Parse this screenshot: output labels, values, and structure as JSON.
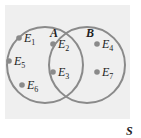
{
  "universe_label": "S",
  "sets": [
    {
      "name": "A",
      "elements": [
        "E1",
        "E5",
        "E6",
        "E2",
        "E3"
      ]
    },
    {
      "name": "B",
      "elements": [
        "E2",
        "E3",
        "E4",
        "E7"
      ]
    }
  ],
  "points": [
    {
      "base": "E",
      "sub": "1",
      "x": 26,
      "y": 42
    },
    {
      "base": "E",
      "sub": "5",
      "x": 16,
      "y": 65
    },
    {
      "base": "E",
      "sub": "6",
      "x": 29,
      "y": 89
    },
    {
      "base": "E",
      "sub": "2",
      "x": 60,
      "y": 48
    },
    {
      "base": "E",
      "sub": "3",
      "x": 60,
      "y": 76
    },
    {
      "base": "E",
      "sub": "4",
      "x": 104,
      "y": 48
    },
    {
      "base": "E",
      "sub": "7",
      "x": 104,
      "y": 76
    }
  ],
  "colors": {
    "circle": "#8a8a8a",
    "dot": "#8a8a8a",
    "background": "#efefef"
  }
}
